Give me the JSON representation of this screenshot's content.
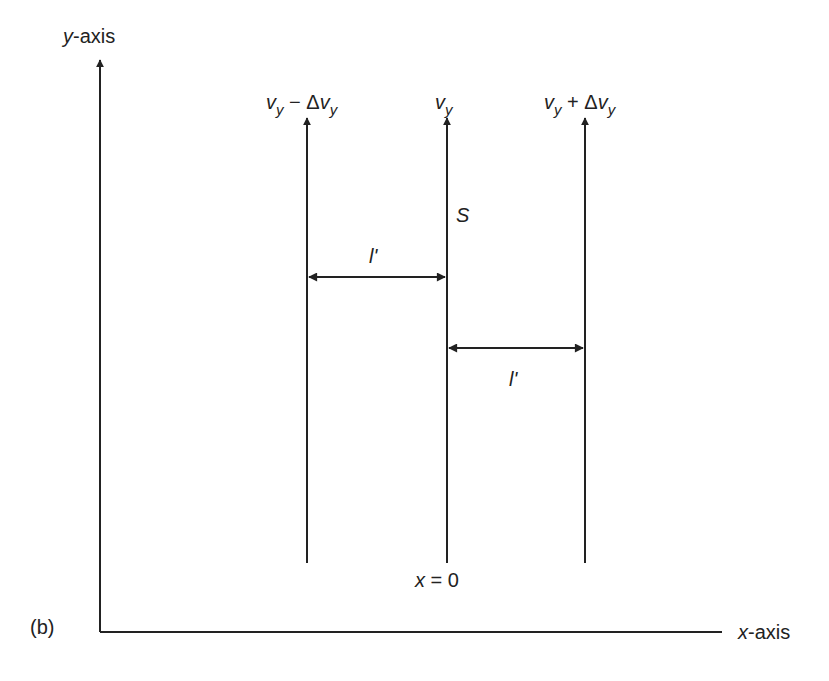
{
  "figure": {
    "panel_label": "(b)",
    "y_axis_label": {
      "var": "y",
      "rest": "-axis"
    },
    "x_axis_label": {
      "var": "x",
      "rest": "-axis"
    },
    "origin_label": {
      "var": "x",
      "rest": " = 0"
    },
    "surface_label": "S",
    "velocity_labels": [
      {
        "base": "v",
        "sub": "y",
        "op": " − Δ",
        "base2": "v",
        "sub2": "y"
      },
      {
        "base": "v",
        "sub": "y"
      },
      {
        "base": "v",
        "sub": "y",
        "op": " + Δ",
        "base2": "v",
        "sub2": "y"
      }
    ],
    "spacing_labels": [
      "l'",
      "l'"
    ],
    "colors": {
      "line": "#222222",
      "background": "#ffffff"
    }
  }
}
